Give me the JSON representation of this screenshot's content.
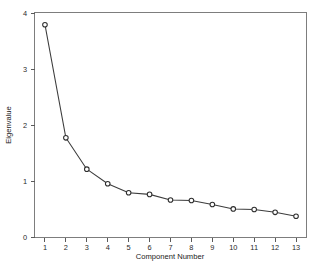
{
  "chart_data": {
    "type": "line",
    "title": "",
    "xlabel": "Component Number",
    "ylabel": "Eigenvalue",
    "categories": [
      1,
      2,
      3,
      4,
      5,
      6,
      7,
      8,
      9,
      10,
      11,
      12,
      13
    ],
    "x_tick_labels": [
      "1",
      "2",
      "3",
      "4",
      "5",
      "6",
      "7",
      "8",
      "9",
      "10",
      "11",
      "12",
      "13"
    ],
    "y_tick_labels": [
      "0",
      "1",
      "2",
      "3",
      "4"
    ],
    "y_ticks": [
      0,
      1,
      2,
      3,
      4
    ],
    "xlim": [
      0.5,
      13.5
    ],
    "ylim": [
      0,
      4
    ],
    "grid": false,
    "legend": false,
    "marker": "open-circle",
    "line_color": "#3c3c3c",
    "marker_fill": "#ffffff",
    "marker_edge": "#2e2e2e",
    "background_color": "#ffffff",
    "frame_color": "#7d7d7d",
    "series": [
      {
        "name": "Eigenvalue",
        "values": [
          3.8,
          1.78,
          1.22,
          0.96,
          0.8,
          0.77,
          0.67,
          0.66,
          0.59,
          0.51,
          0.5,
          0.45,
          0.38
        ]
      }
    ]
  },
  "figure": {
    "axis_label_x": "Component Number",
    "axis_label_y": "Eigenvalue"
  }
}
